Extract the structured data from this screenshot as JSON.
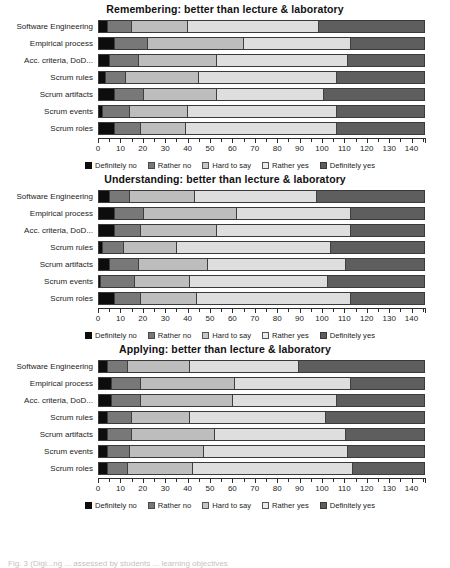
{
  "figure": {
    "caption": "Fig. 3   (Digi...ng ... assessed by students ... learning objectives"
  },
  "legend": {
    "items": [
      {
        "label": "Definitely no",
        "color": "#0d0d0d",
        "key": "k0"
      },
      {
        "label": "Rather no",
        "color": "#787878",
        "key": "k1"
      },
      {
        "label": "Hard to say",
        "color": "#c6c6c6",
        "key": "k2"
      },
      {
        "label": "Rather yes",
        "color": "#ececec",
        "key": "k3"
      },
      {
        "label": "Definitely yes",
        "color": "#5e5e5e",
        "key": "k4"
      }
    ]
  },
  "axis": {
    "min": 0,
    "max": 146,
    "ticks": [
      0,
      5,
      10,
      15,
      20,
      25,
      30,
      35,
      40,
      45,
      50,
      55,
      60,
      65,
      70,
      75,
      80,
      85,
      90,
      95,
      100,
      105,
      110,
      115,
      120,
      125,
      130,
      135,
      140,
      145
    ],
    "labeled_ticks": [
      0,
      10,
      20,
      30,
      40,
      50,
      60,
      70,
      80,
      90,
      100,
      110,
      120,
      130,
      140
    ],
    "tick_labels": [
      "0",
      "10",
      "20",
      "30",
      "40",
      "50",
      "60",
      "70",
      "80",
      "90",
      "100",
      "110",
      "120",
      "130",
      "140"
    ]
  },
  "categories": [
    "Software Engineering",
    "Empirical process",
    "Acc. criteria, DoD...",
    "Scrum rules",
    "Scrum artifacts",
    "Scrum events",
    "Scrum roles"
  ],
  "chart_data": [
    {
      "type": "bar",
      "orientation": "horizontal",
      "stacked": true,
      "title": "Remembering:  better than lecture & laboratory",
      "xlabel": "",
      "ylabel": "",
      "xlim": [
        0,
        146
      ],
      "grid": false,
      "legend_position": "bottom",
      "categories": [
        "Software Engineering",
        "Empirical process",
        "Acc. criteria, DoD...",
        "Scrum rules",
        "Scrum artifacts",
        "Scrum events",
        "Scrum roles"
      ],
      "series": [
        {
          "name": "Definitely no",
          "values": [
            4,
            7,
            5,
            3,
            7,
            2,
            7
          ]
        },
        {
          "name": "Rather no",
          "values": [
            11,
            15,
            13,
            9,
            13,
            12,
            12
          ]
        },
        {
          "name": "Hard to say",
          "values": [
            25,
            43,
            35,
            33,
            33,
            26,
            20
          ]
        },
        {
          "name": "Rather yes",
          "values": [
            59,
            48,
            59,
            62,
            48,
            67,
            68
          ]
        },
        {
          "name": "Definitely yes",
          "values": [
            47,
            33,
            34,
            39,
            45,
            39,
            39
          ]
        }
      ]
    },
    {
      "type": "bar",
      "orientation": "horizontal",
      "stacked": true,
      "title": "Understanding:  better than lecture & laboratory",
      "xlabel": "",
      "ylabel": "",
      "xlim": [
        0,
        146
      ],
      "grid": false,
      "legend_position": "bottom",
      "categories": [
        "Software Engineering",
        "Empirical process",
        "Acc. criteria, DoD...",
        "Scrum rules",
        "Scrum artifacts",
        "Scrum events",
        "Scrum roles"
      ],
      "series": [
        {
          "name": "Definitely no",
          "values": [
            5,
            7,
            7,
            2,
            5,
            1,
            7
          ]
        },
        {
          "name": "Rather no",
          "values": [
            9,
            13,
            12,
            9,
            13,
            15,
            12
          ]
        },
        {
          "name": "Hard to say",
          "values": [
            29,
            42,
            34,
            24,
            31,
            25,
            25
          ]
        },
        {
          "name": "Rather yes",
          "values": [
            55,
            51,
            60,
            69,
            62,
            62,
            69
          ]
        },
        {
          "name": "Definitely yes",
          "values": [
            48,
            33,
            33,
            42,
            35,
            43,
            33
          ]
        }
      ]
    },
    {
      "type": "bar",
      "orientation": "horizontal",
      "stacked": true,
      "title": "Applying:  better than lecture & laboratory",
      "xlabel": "",
      "ylabel": "",
      "xlim": [
        0,
        146
      ],
      "grid": false,
      "legend_position": "bottom",
      "categories": [
        "Software Engineering",
        "Empirical process",
        "Acc. criteria, DoD...",
        "Scrum rules",
        "Scrum artifacts",
        "Scrum events",
        "Scrum roles"
      ],
      "series": [
        {
          "name": "Definitely no",
          "values": [
            4,
            6,
            6,
            4,
            4,
            4,
            4
          ]
        },
        {
          "name": "Rather no",
          "values": [
            9,
            13,
            13,
            11,
            11,
            10,
            9
          ]
        },
        {
          "name": "Hard to say",
          "values": [
            28,
            42,
            41,
            26,
            37,
            33,
            29
          ]
        },
        {
          "name": "Rather yes",
          "values": [
            49,
            52,
            47,
            61,
            59,
            65,
            72
          ]
        },
        {
          "name": "Definitely yes",
          "values": [
            56,
            33,
            39,
            44,
            35,
            34,
            32
          ]
        }
      ]
    }
  ]
}
